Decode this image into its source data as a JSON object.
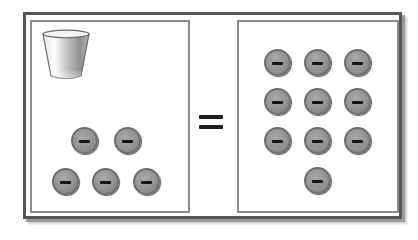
{
  "diagram": {
    "left_panel": {
      "cup_icon": "cup-icon",
      "charges": [
        {
          "sign": "negative",
          "x": 71,
          "y": 127
        },
        {
          "sign": "negative",
          "x": 114,
          "y": 127
        },
        {
          "sign": "negative",
          "x": 52,
          "y": 168
        },
        {
          "sign": "negative",
          "x": 92,
          "y": 168
        },
        {
          "sign": "negative",
          "x": 133,
          "y": 168
        }
      ],
      "charge_count": 5
    },
    "operator": "=",
    "right_panel": {
      "charges": [
        {
          "sign": "negative",
          "x": 264,
          "y": 49
        },
        {
          "sign": "negative",
          "x": 304,
          "y": 49
        },
        {
          "sign": "negative",
          "x": 344,
          "y": 49
        },
        {
          "sign": "negative",
          "x": 264,
          "y": 88
        },
        {
          "sign": "negative",
          "x": 304,
          "y": 88
        },
        {
          "sign": "negative",
          "x": 344,
          "y": 88
        },
        {
          "sign": "negative",
          "x": 264,
          "y": 127
        },
        {
          "sign": "negative",
          "x": 304,
          "y": 127
        },
        {
          "sign": "negative",
          "x": 344,
          "y": 127
        },
        {
          "sign": "negative",
          "x": 304,
          "y": 167
        }
      ],
      "charge_count": 10
    },
    "colors": {
      "frame": "#555555",
      "panel_border": "#8c8c8c",
      "charge_fill": "#939393",
      "minus_sign": "#151515"
    }
  }
}
